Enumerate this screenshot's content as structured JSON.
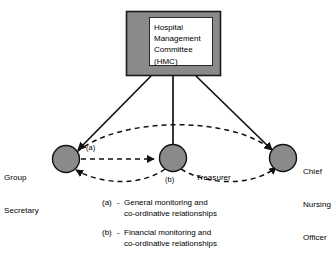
{
  "diagram": {
    "title_box": {
      "name": "hospital-management-committee",
      "lines": [
        "Hospital",
        "Management",
        "Committee",
        "(HMC)"
      ],
      "fill_color": "#8a8a8a",
      "border_color": "#1a1a1a",
      "inner_fill": "#ffffff"
    },
    "nodes": [
      {
        "id": "group-secretary",
        "lines": [
          "Group",
          "Secretary"
        ],
        "cx": 66,
        "cy": 159,
        "r": 13.5,
        "fill_color": "#8a8a8a"
      },
      {
        "id": "treasurer",
        "lines": [
          "Treasurer"
        ],
        "cx": 173,
        "cy": 158,
        "r": 13.5,
        "fill_color": "#8a8a8a"
      },
      {
        "id": "chief-nursing-officer",
        "lines": [
          "Chief",
          "Nursing",
          "Officer"
        ],
        "cx": 283,
        "cy": 158,
        "r": 13.5,
        "fill_color": "#8a8a8a"
      }
    ],
    "edge_labels": {
      "a": "(a)",
      "b": "(b)"
    },
    "legend": [
      {
        "key": "(a)",
        "dash": "-",
        "lines": [
          "General monitoring and",
          "co-ordinative relationships"
        ]
      },
      {
        "key": "(b)",
        "dash": "-",
        "lines": [
          "Financial monitoring and",
          "co-ordinative relationships"
        ]
      }
    ]
  }
}
